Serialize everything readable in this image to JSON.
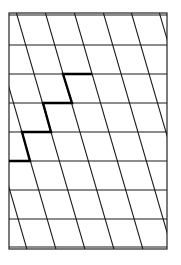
{
  "diagram": {
    "title": "",
    "canvas": {
      "width": 181,
      "height": 265,
      "background": "#ffffff"
    },
    "frame": {
      "x1": 9,
      "y1": 13,
      "x2": 167,
      "y2": 249,
      "inner_top": 15,
      "inner_bottom": 247,
      "color": "#222222"
    },
    "horizontal_lines_y": [
      45,
      74,
      103,
      132,
      161,
      190,
      219
    ],
    "diagonals": {
      "slope_dx_per_dy": 0.29,
      "reference_y": 15,
      "x_at_reference": [
        -41,
        -12,
        17,
        46,
        75,
        104,
        132,
        160
      ],
      "color": "#1a1a1a"
    },
    "highlighted_staircase": {
      "color": "#000000",
      "points": [
        [
          92,
          74
        ],
        [
          63,
          74
        ],
        [
          72,
          103
        ],
        [
          43,
          103
        ],
        [
          51,
          132
        ],
        [
          22,
          132
        ],
        [
          30,
          161
        ],
        [
          9,
          161
        ]
      ]
    }
  }
}
